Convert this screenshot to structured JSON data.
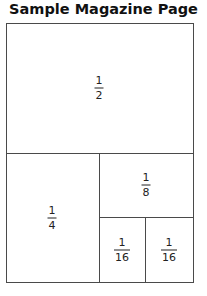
{
  "title": "Sample Magazine Page",
  "sections": [
    {
      "id": "half",
      "numerator": "1",
      "denominator": "2"
    },
    {
      "id": "quarter",
      "numerator": "1",
      "denominator": "4"
    },
    {
      "id": "eighth",
      "numerator": "1",
      "denominator": "8"
    },
    {
      "id": "sixteenth-left",
      "numerator": "1",
      "denominator": "16"
    },
    {
      "id": "sixteenth-right",
      "numerator": "1",
      "denominator": "16"
    }
  ],
  "colors": {
    "line": "#4a4a4a",
    "text": "#111111",
    "background": "#ffffff"
  }
}
